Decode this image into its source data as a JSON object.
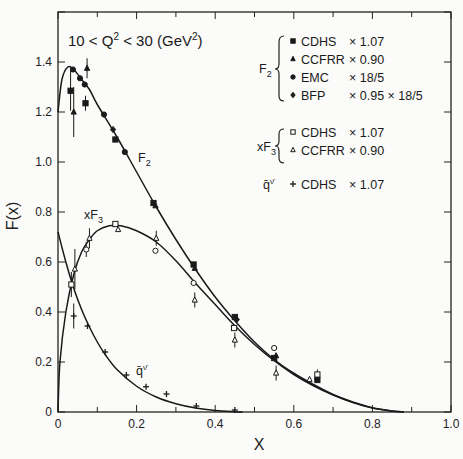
{
  "chart_data": {
    "type": "scatter",
    "xlabel": "X",
    "ylabel": "F(x)",
    "xlim": [
      0,
      1.0
    ],
    "ylim": [
      0,
      1.6
    ],
    "x_ticks": [
      "0",
      "0.2",
      "0.4",
      "0.6",
      "0.8",
      "1.0"
    ],
    "y_ticks": [
      "0",
      "0.2",
      "0.4",
      "0.6",
      "0.8",
      "1.0",
      "1.2",
      "1.4"
    ],
    "grid": false,
    "legend_position": "upper right",
    "legend": [
      {
        "group": "F2",
        "marker": "filled-square",
        "label": "CDHS",
        "factor": "× 1.07"
      },
      {
        "group": "F2",
        "marker": "filled-triangle",
        "label": "CCFRR",
        "factor": "× 0.90"
      },
      {
        "group": "F2",
        "marker": "filled-circle",
        "label": "EMC",
        "factor": "× 18/5"
      },
      {
        "group": "F2",
        "marker": "filled-diamond",
        "label": "BFP",
        "factor": "× 0.95 × 18/5"
      },
      {
        "group": "xF3",
        "marker": "open-square",
        "label": "CDHS",
        "factor": "× 1.07"
      },
      {
        "group": "xF3",
        "marker": "open-triangle",
        "label": "CCFRR",
        "factor": "× 0.90"
      },
      {
        "group": "q̄ᵛ",
        "marker": "plus",
        "label": "CDHS",
        "factor": "× 1.07"
      }
    ],
    "series": [
      {
        "name": "F2",
        "points": [
          {
            "x": 0.032,
            "y": 1.285,
            "marker": "filled-square",
            "err": 0.08
          },
          {
            "x": 0.038,
            "y": 1.37,
            "marker": "filled-circle"
          },
          {
            "x": 0.04,
            "y": 1.2,
            "marker": "filled-triangle",
            "err": 0.1
          },
          {
            "x": 0.056,
            "y": 1.335,
            "marker": "filled-circle"
          },
          {
            "x": 0.068,
            "y": 1.31,
            "marker": "filled-circle"
          },
          {
            "x": 0.07,
            "y": 1.235,
            "marker": "filled-square",
            "err": 0.03
          },
          {
            "x": 0.074,
            "y": 1.375,
            "marker": "filled-triangle",
            "err": 0.04
          },
          {
            "x": 0.117,
            "y": 1.19,
            "marker": "filled-circle"
          },
          {
            "x": 0.14,
            "y": 1.13,
            "marker": "filled-diamond"
          },
          {
            "x": 0.146,
            "y": 1.09,
            "marker": "filled-square"
          },
          {
            "x": 0.17,
            "y": 1.04,
            "marker": "filled-circle"
          },
          {
            "x": 0.243,
            "y": 0.836,
            "marker": "filled-square"
          },
          {
            "x": 0.248,
            "y": 0.825,
            "marker": "filled-triangle"
          },
          {
            "x": 0.345,
            "y": 0.59,
            "marker": "filled-square"
          },
          {
            "x": 0.348,
            "y": 0.575,
            "marker": "filled-triangle"
          },
          {
            "x": 0.45,
            "y": 0.38,
            "marker": "filled-square"
          },
          {
            "x": 0.455,
            "y": 0.37,
            "marker": "filled-diamond"
          },
          {
            "x": 0.55,
            "y": 0.216,
            "marker": "filled-square"
          },
          {
            "x": 0.555,
            "y": 0.225,
            "marker": "filled-triangle"
          },
          {
            "x": 0.66,
            "y": 0.128,
            "marker": "filled-square"
          },
          {
            "x": 0.66,
            "y": 0.14,
            "marker": "filled-triangle",
            "err": 0.02
          }
        ],
        "curve": [
          [
            0.0,
            1.2
          ],
          [
            0.01,
            1.33
          ],
          [
            0.025,
            1.38
          ],
          [
            0.04,
            1.37
          ],
          [
            0.06,
            1.33
          ],
          [
            0.08,
            1.29
          ],
          [
            0.1,
            1.23
          ],
          [
            0.15,
            1.1
          ],
          [
            0.2,
            0.96
          ],
          [
            0.25,
            0.82
          ],
          [
            0.3,
            0.69
          ],
          [
            0.35,
            0.57
          ],
          [
            0.4,
            0.46
          ],
          [
            0.45,
            0.365
          ],
          [
            0.5,
            0.28
          ],
          [
            0.55,
            0.21
          ],
          [
            0.6,
            0.155
          ],
          [
            0.65,
            0.11
          ],
          [
            0.7,
            0.07
          ],
          [
            0.75,
            0.04
          ],
          [
            0.8,
            0.017
          ],
          [
            0.85,
            0.004
          ],
          [
            0.88,
            0.0
          ]
        ]
      },
      {
        "name": "xF3",
        "points": [
          {
            "x": 0.034,
            "y": 0.51,
            "marker": "open-square",
            "err": 0.05
          },
          {
            "x": 0.043,
            "y": 0.572,
            "marker": "open-triangle",
            "err": 0.08
          },
          {
            "x": 0.072,
            "y": 0.65,
            "marker": "open-circle",
            "err": 0.03
          },
          {
            "x": 0.08,
            "y": 0.695,
            "marker": "open-triangle",
            "err": 0.04
          },
          {
            "x": 0.146,
            "y": 0.752,
            "marker": "open-square"
          },
          {
            "x": 0.153,
            "y": 0.73,
            "marker": "open-triangle"
          },
          {
            "x": 0.248,
            "y": 0.645,
            "marker": "open-circle"
          },
          {
            "x": 0.25,
            "y": 0.695,
            "marker": "open-triangle",
            "err": 0.03
          },
          {
            "x": 0.345,
            "y": 0.516,
            "marker": "open-circle"
          },
          {
            "x": 0.348,
            "y": 0.448,
            "marker": "open-triangle",
            "err": 0.03
          },
          {
            "x": 0.448,
            "y": 0.336,
            "marker": "open-square"
          },
          {
            "x": 0.45,
            "y": 0.288,
            "marker": "open-triangle",
            "err": 0.03
          },
          {
            "x": 0.55,
            "y": 0.256,
            "marker": "open-circle"
          },
          {
            "x": 0.555,
            "y": 0.156,
            "marker": "open-triangle",
            "err": 0.03
          },
          {
            "x": 0.64,
            "y": 0.13,
            "marker": "open-triangle"
          },
          {
            "x": 0.66,
            "y": 0.15,
            "marker": "open-square",
            "err": 0.02
          }
        ],
        "curve": [
          [
            0.0,
            0.0
          ],
          [
            0.005,
            0.2
          ],
          [
            0.02,
            0.4
          ],
          [
            0.04,
            0.55
          ],
          [
            0.06,
            0.64
          ],
          [
            0.08,
            0.69
          ],
          [
            0.1,
            0.725
          ],
          [
            0.13,
            0.745
          ],
          [
            0.16,
            0.745
          ],
          [
            0.2,
            0.725
          ],
          [
            0.25,
            0.68
          ],
          [
            0.3,
            0.605
          ],
          [
            0.35,
            0.515
          ],
          [
            0.4,
            0.43
          ],
          [
            0.45,
            0.345
          ],
          [
            0.5,
            0.27
          ],
          [
            0.55,
            0.205
          ],
          [
            0.6,
            0.15
          ],
          [
            0.65,
            0.105
          ],
          [
            0.7,
            0.068
          ],
          [
            0.75,
            0.038
          ],
          [
            0.8,
            0.016
          ],
          [
            0.85,
            0.004
          ],
          [
            0.88,
            0.0
          ]
        ]
      },
      {
        "name": "q̄ᵛ",
        "points": [
          {
            "x": 0.04,
            "y": 0.384,
            "marker": "plus",
            "err": 0.05
          },
          {
            "x": 0.075,
            "y": 0.344,
            "marker": "plus"
          },
          {
            "x": 0.12,
            "y": 0.24,
            "marker": "plus"
          },
          {
            "x": 0.174,
            "y": 0.148,
            "marker": "plus"
          },
          {
            "x": 0.224,
            "y": 0.101,
            "marker": "plus"
          },
          {
            "x": 0.276,
            "y": 0.072,
            "marker": "plus"
          },
          {
            "x": 0.352,
            "y": 0.024,
            "marker": "plus"
          },
          {
            "x": 0.45,
            "y": 0.008,
            "marker": "plus"
          }
        ],
        "curve": [
          [
            0.0,
            0.72
          ],
          [
            0.02,
            0.6
          ],
          [
            0.04,
            0.495
          ],
          [
            0.06,
            0.41
          ],
          [
            0.08,
            0.34
          ],
          [
            0.1,
            0.28
          ],
          [
            0.12,
            0.23
          ],
          [
            0.15,
            0.17
          ],
          [
            0.2,
            0.103
          ],
          [
            0.25,
            0.06
          ],
          [
            0.3,
            0.033
          ],
          [
            0.35,
            0.016
          ],
          [
            0.4,
            0.006
          ],
          [
            0.45,
            0.001
          ],
          [
            0.47,
            0.0
          ]
        ]
      }
    ],
    "annotations": [
      {
        "text": "F₂",
        "x": 0.21,
        "y": 0.98
      },
      {
        "text": "xF₃",
        "x": 0.065,
        "y": 0.78
      },
      {
        "text": "q̄ᵛ",
        "x": 0.2,
        "y": 0.15
      }
    ]
  },
  "labels": {
    "title_main": "10 < Q",
    "title_sup1": "2",
    "title_mid": " < 30 (GeV",
    "title_sup2": "2",
    "title_end": ")",
    "xlabel": "X",
    "ylabel": "F(x)",
    "curve_F2": "F",
    "curve_F2_sub": "2",
    "curve_xF3": "xF",
    "curve_xF3_sub": "3",
    "curve_qbar": "q̄",
    "curve_qbar_sup": "ν̄",
    "legend_F2": "F",
    "legend_F2_sub": "2",
    "legend_xF3": "xF",
    "legend_xF3_sub": "3",
    "legend_qbar": "q̄",
    "legend_qbar_sup": "ν̄"
  }
}
